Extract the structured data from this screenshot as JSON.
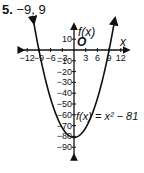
{
  "problem": {
    "number": "5.",
    "answer": "−9, 9"
  },
  "chart_data": {
    "type": "line",
    "title": "",
    "xlabel": "x",
    "ylabel": "f(x)",
    "origin_label": "O",
    "function_label": "f(x) = x² − 81",
    "function": "x^2 - 81",
    "xlim": [
      -13,
      13
    ],
    "ylim": [
      -95,
      15
    ],
    "x_ticks": [
      -12,
      -9,
      -6,
      -3,
      3,
      6,
      9,
      12
    ],
    "x_tick_labels": [
      "−12",
      "−9",
      "−6",
      "−3",
      "3",
      "6",
      "9",
      "12"
    ],
    "y_ticks": [
      10,
      -10,
      -20,
      -30,
      -40,
      -50,
      -60,
      -70,
      -80,
      -90
    ],
    "y_tick_labels": [
      "10",
      "−10",
      "−20",
      "−30",
      "−40",
      "−50",
      "−60",
      "−70",
      "−80",
      "−90"
    ],
    "series": [
      {
        "name": "f(x) = x² − 81",
        "x": [
          -10.5,
          -9,
          -6,
          -3,
          0,
          3,
          6,
          9,
          10.5
        ],
        "y": [
          29.25,
          0,
          -45,
          -72,
          -81,
          -72,
          -45,
          0,
          29.25
        ]
      }
    ],
    "zeros": [
      -9,
      9
    ],
    "vertex": [
      0,
      -81
    ],
    "grid": false
  }
}
